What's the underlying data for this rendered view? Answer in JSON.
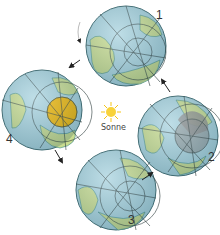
{
  "diagram": {
    "title": "",
    "sun": {
      "label": "Sonne",
      "color": "#f5c518"
    },
    "globes": [
      {
        "id": 1,
        "label": "1",
        "cx": 126,
        "cy": 46,
        "highlight": null
      },
      {
        "id": 2,
        "label": "2",
        "cx": 178,
        "cy": 136,
        "highlight": "#8a8a8a"
      },
      {
        "id": 3,
        "label": "3",
        "cx": 116,
        "cy": 190,
        "highlight": null
      },
      {
        "id": 4,
        "label": "4",
        "cx": 42,
        "cy": 110,
        "highlight": "#f2b705"
      }
    ],
    "arrows": [
      "1->4",
      "4->3",
      "3->2",
      "2->1"
    ],
    "colors": {
      "ocean": "#a9d3df",
      "land": "#c9dc8f",
      "grid": "#2b3a3a",
      "coast": "#3a8a8f"
    }
  }
}
